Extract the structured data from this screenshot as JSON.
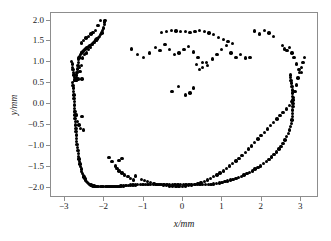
{
  "chart_data": {
    "type": "scatter",
    "title": "",
    "xlabel": "x/mm",
    "ylabel": "y/mm",
    "xlim": [
      -3.35,
      3.45
    ],
    "ylim": [
      -2.25,
      2.18
    ],
    "xticks": [
      -3,
      -2,
      -1,
      0,
      1,
      2,
      3
    ],
    "xticklabels": [
      "−3",
      "−2",
      "−1",
      "0",
      "1",
      "2",
      "3"
    ],
    "yticks": [
      2.0,
      1.5,
      1.0,
      0.5,
      0.0,
      -0.5,
      -1.0,
      -1.5,
      -2.0
    ],
    "yticklabels": [
      "2.0",
      "1.5",
      "1.0",
      "0.5",
      "0.0",
      "−0.5",
      "−1.0",
      "−1.5",
      "−2.0"
    ],
    "grid": false,
    "legend": null,
    "marker": "circle",
    "marker_color": "#000000",
    "marker_size": 3.4,
    "series": [
      {
        "name": "points",
        "x": [
          -2.8,
          -2.79,
          -2.78,
          -2.78,
          -2.77,
          -2.77,
          -2.76,
          -2.76,
          -2.75,
          -2.75,
          -2.74,
          -2.74,
          -2.73,
          -2.73,
          -2.72,
          -2.72,
          -2.71,
          -2.7,
          -2.7,
          -2.69,
          -2.68,
          -2.67,
          -2.66,
          -2.65,
          -2.64,
          -2.62,
          -2.61,
          -2.6,
          -2.58,
          -2.57,
          -2.55,
          -2.53,
          -2.51,
          -2.49,
          -2.47,
          -2.45,
          -2.42,
          -2.4,
          -2.37,
          -2.34,
          -2.31,
          -2.28,
          -2.25,
          -2.21,
          -2.18,
          -2.14,
          -2.1,
          -2.06,
          -2.02,
          -1.97,
          -1.93,
          -1.88,
          -1.83,
          -1.78,
          -1.73,
          -1.68,
          -1.62,
          -1.57,
          -1.51,
          -1.45,
          -1.39,
          -1.33,
          -1.27,
          -1.21,
          -1.15,
          -1.08,
          -1.02,
          -0.95,
          -0.89,
          -0.82,
          -0.75,
          -0.69,
          -0.62,
          -0.55,
          -0.48,
          -0.41,
          -0.34,
          -0.27,
          -0.2,
          -0.13,
          -0.06,
          0.01,
          0.08,
          0.15,
          0.22,
          0.29,
          0.36,
          0.43,
          0.5,
          0.57,
          0.64,
          0.71,
          0.78,
          0.85,
          0.92,
          0.99,
          1.06,
          1.13,
          1.2,
          1.27,
          1.34,
          1.41,
          1.48,
          1.55,
          1.62,
          1.69,
          1.76,
          1.83,
          1.9,
          1.97,
          2.04,
          2.11,
          2.18,
          2.25,
          2.31,
          2.37,
          2.43,
          2.49,
          2.54,
          2.59,
          2.63,
          2.67,
          2.7,
          2.73,
          2.75,
          2.76,
          2.77,
          2.78,
          2.78,
          2.79,
          2.79,
          2.79,
          2.78,
          2.78,
          2.77,
          2.76,
          2.75,
          2.74,
          2.73,
          2.72,
          -2.83,
          -2.81,
          -2.8,
          -2.79,
          -2.78,
          -2.77,
          -2.76,
          -2.75,
          -2.74,
          -2.73,
          -2.72,
          -2.71,
          -2.7,
          -2.69,
          -2.68,
          -2.67,
          -2.66,
          -2.65,
          -2.64,
          -2.63,
          -2.62,
          -2.6,
          -2.58,
          -2.56,
          -2.54,
          -2.52,
          -2.5,
          -2.48,
          -2.45,
          -2.42,
          -2.39,
          -2.36,
          -2.33,
          -2.3,
          -2.27,
          -2.24,
          -2.21,
          -2.18,
          -2.15,
          -2.12,
          -2.09,
          -2.06,
          -2.04,
          -2.02,
          -2.0,
          -1.99,
          -1.98,
          -2.62,
          -2.58,
          -2.55,
          -2.72,
          -2.7,
          -2.66,
          -2.61,
          -2.56,
          -2.5,
          -2.45,
          -2.4,
          -2.35,
          -2.3,
          -2.25,
          -2.2,
          -2.74,
          -2.71,
          -2.68,
          -2.64,
          -2.6,
          -2.56,
          -2.52,
          -1.62,
          -1.55,
          -1.2,
          -1.05,
          -0.98,
          -0.9,
          -0.82,
          -0.74,
          -0.66,
          -0.58,
          -0.5,
          -0.42,
          -0.34,
          -0.26,
          -0.18,
          -0.1,
          -0.02,
          0.06,
          0.14,
          0.22,
          -1.88,
          -1.8,
          -1.72,
          -1.68,
          -1.62,
          -1.55,
          -1.48,
          -1.4,
          -1.33,
          -1.26,
          0.3,
          0.38,
          0.46,
          0.54,
          0.62,
          0.7,
          0.78,
          0.86,
          0.94,
          1.02,
          1.1,
          1.18,
          1.26,
          1.34,
          1.42,
          1.5,
          1.58,
          1.66,
          1.74,
          1.82,
          1.9,
          1.98,
          2.06,
          2.14,
          2.22,
          2.3,
          2.38,
          2.46,
          2.54,
          2.62,
          2.7,
          2.76,
          2.8,
          2.84,
          2.88,
          2.92,
          2.96,
          3.0,
          3.04,
          3.08,
          -0.55,
          -0.42,
          -0.3,
          -0.18,
          -0.06,
          0.06,
          0.18,
          0.3,
          0.42,
          0.54,
          0.66,
          0.78,
          0.9,
          1.02,
          1.14,
          1.26,
          -1.3,
          -1.15,
          -1.0,
          -0.85,
          -0.7,
          -0.58,
          -0.46,
          -0.34,
          -0.22,
          -0.1,
          0.02,
          0.14,
          0.26,
          0.38,
          0.5,
          0.62,
          0.74,
          0.86,
          0.98,
          1.1,
          1.22,
          1.34,
          1.46,
          1.58,
          1.7,
          1.82,
          1.94,
          2.06,
          2.18,
          2.3,
          -0.28,
          -0.12,
          0.06,
          0.18,
          0.26,
          0.34,
          0.42,
          0.5,
          0.6,
          -2.58,
          -2.52,
          -2.46,
          -2.4,
          -2.34,
          -2.28,
          -2.22,
          -2.16,
          -2.1,
          2.52,
          2.58,
          2.64,
          2.7,
          2.76,
          2.82,
          2.88,
          2.94,
          3.0
        ],
        "y": [
          0.52,
          0.45,
          0.38,
          0.3,
          0.22,
          0.14,
          0.06,
          -0.02,
          -0.1,
          -0.18,
          -0.26,
          -0.34,
          -0.42,
          -0.5,
          -0.58,
          -0.66,
          -0.74,
          -0.82,
          -0.9,
          -0.97,
          -1.04,
          -1.11,
          -1.18,
          -1.25,
          -1.32,
          -1.38,
          -1.44,
          -1.5,
          -1.56,
          -1.61,
          -1.66,
          -1.71,
          -1.75,
          -1.79,
          -1.82,
          -1.85,
          -1.88,
          -1.9,
          -1.92,
          -1.94,
          -1.95,
          -1.96,
          -1.96,
          -1.97,
          -1.97,
          -1.97,
          -1.97,
          -1.97,
          -1.97,
          -1.97,
          -1.97,
          -1.97,
          -1.97,
          -1.97,
          -1.97,
          -1.97,
          -1.97,
          -1.96,
          -1.96,
          -1.95,
          -1.95,
          -1.94,
          -1.94,
          -1.94,
          -1.93,
          -1.93,
          -1.93,
          -1.93,
          -1.93,
          -1.93,
          -1.93,
          -1.93,
          -1.93,
          -1.93,
          -1.93,
          -1.93,
          -1.93,
          -1.93,
          -1.93,
          -1.93,
          -1.93,
          -1.93,
          -1.93,
          -1.93,
          -1.93,
          -1.93,
          -1.93,
          -1.93,
          -1.93,
          -1.93,
          -1.93,
          -1.92,
          -1.91,
          -1.9,
          -1.89,
          -1.88,
          -1.86,
          -1.84,
          -1.82,
          -1.8,
          -1.78,
          -1.76,
          -1.73,
          -1.7,
          -1.67,
          -1.64,
          -1.6,
          -1.56,
          -1.52,
          -1.48,
          -1.43,
          -1.38,
          -1.33,
          -1.27,
          -1.21,
          -1.15,
          -1.08,
          -1.01,
          -0.94,
          -0.86,
          -0.78,
          -0.7,
          -0.62,
          -0.54,
          -0.46,
          -0.38,
          -0.3,
          -0.22,
          -0.14,
          -0.06,
          0.02,
          0.1,
          0.18,
          0.26,
          0.34,
          0.42,
          0.5,
          0.57,
          0.64,
          0.7,
          1.02,
          0.96,
          0.88,
          0.82,
          0.76,
          0.7,
          0.64,
          0.58,
          0.57,
          0.58,
          0.6,
          0.64,
          0.7,
          0.76,
          0.84,
          0.92,
          1.0,
          1.06,
          1.1,
          1.12,
          1.14,
          1.18,
          1.22,
          1.24,
          1.26,
          1.28,
          1.3,
          1.32,
          1.34,
          1.36,
          1.38,
          1.4,
          1.42,
          1.45,
          1.48,
          1.5,
          1.53,
          1.56,
          1.59,
          1.62,
          1.66,
          1.7,
          1.76,
          1.82,
          1.9,
          1.96,
          2.0,
          0.88,
          0.92,
          1.1,
          0.58,
          0.58,
          0.6,
          0.78,
          0.6,
          1.18,
          1.22,
          1.3,
          1.36,
          1.42,
          1.48,
          1.52,
          -0.18,
          -0.26,
          -0.42,
          -0.5,
          -0.58,
          -0.3,
          -0.62,
          -1.35,
          -1.3,
          -1.72,
          -1.8,
          -1.83,
          -1.85,
          -1.88,
          -1.9,
          -1.92,
          -1.93,
          -1.94,
          -1.95,
          -1.96,
          -1.96,
          -1.97,
          -1.97,
          -1.97,
          -1.96,
          -1.95,
          -1.94,
          -1.28,
          -1.38,
          -1.48,
          -1.55,
          -1.6,
          -1.65,
          -1.7,
          -1.74,
          -1.78,
          -1.82,
          -1.92,
          -1.9,
          -1.88,
          -1.85,
          -1.82,
          -1.78,
          -1.74,
          -1.7,
          -1.65,
          -1.6,
          -1.54,
          -1.48,
          -1.42,
          -1.36,
          -1.3,
          -1.23,
          -1.16,
          -1.08,
          -1.0,
          -0.92,
          -0.84,
          -0.76,
          -0.68,
          -0.6,
          -0.52,
          -0.44,
          -0.36,
          -0.28,
          -0.2,
          -0.12,
          -0.04,
          0.06,
          0.16,
          0.3,
          0.46,
          0.62,
          0.76,
          0.88,
          1.0,
          1.12,
          1.72,
          1.74,
          1.76,
          1.75,
          1.74,
          1.73,
          1.72,
          1.74,
          1.76,
          1.74,
          1.7,
          1.66,
          1.6,
          1.55,
          1.5,
          1.45,
          1.32,
          1.18,
          1.12,
          1.22,
          1.35,
          1.28,
          1.42,
          1.3,
          1.18,
          1.22,
          1.3,
          1.38,
          1.25,
          1.12,
          1.0,
          0.92,
          1.08,
          1.18,
          1.3,
          1.4,
          1.22,
          1.12,
          1.18,
          1.1,
          1.12,
          1.75,
          1.68,
          1.76,
          1.7,
          1.62,
          0.3,
          0.42,
          0.22,
          0.26,
          0.38,
          0.95,
          0.82,
          0.88,
          1.0,
          1.46,
          1.52,
          1.58,
          1.62,
          1.68,
          1.72,
          1.76,
          1.88,
          2.0,
          1.4,
          1.32,
          1.28,
          1.35,
          1.22,
          1.12,
          0.96,
          0.82,
          0.76
        ]
      }
    ]
  },
  "axes": {
    "xlabel": "x/mm",
    "ylabel": "y/mm"
  }
}
